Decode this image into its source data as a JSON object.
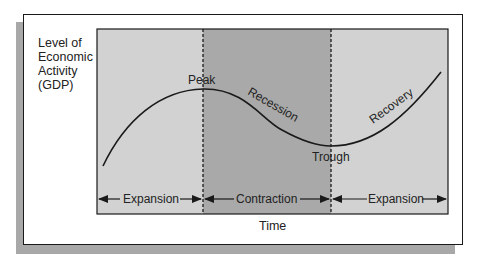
{
  "diagram": {
    "y_axis_label_lines": [
      "Level of",
      "Economic",
      "Activity",
      "(GDP)"
    ],
    "x_axis_label": "Time",
    "curve_labels": {
      "peak": "Peak",
      "recession": "Recession",
      "trough": "Trough",
      "recovery": "Recovery"
    },
    "phases": [
      {
        "label": "Expansion",
        "shade": "#d2d2d2"
      },
      {
        "label": "Contraction",
        "shade": "#a9a9a9"
      },
      {
        "label": "Expansion",
        "shade": "#d2d2d2"
      }
    ],
    "colors": {
      "light_region": "#d2d2d2",
      "dark_region": "#a9a9a9",
      "line": "#1a1a1a",
      "shadow": "#a8a8a8"
    }
  }
}
